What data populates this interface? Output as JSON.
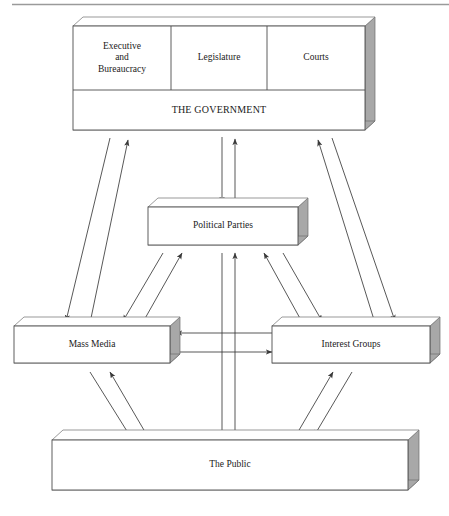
{
  "figure": {
    "type": "flow-diagram",
    "title": "",
    "has_top_rule": true,
    "background_color": "#ffffff",
    "line_color": "#333333",
    "box_fill": "#ffffff",
    "box_stroke": "#4d4d4d",
    "shadow_color": "#a8a8a8"
  },
  "nodes": {
    "government_group": {
      "name": "THE GOVERNMENT",
      "cells": [
        {
          "id": "executive",
          "label": "Executive\nand\nBureaucracy",
          "line1": "Executive",
          "line2": "and",
          "line3": "Bureaucracy"
        },
        {
          "id": "legislature",
          "label": "Legislature"
        },
        {
          "id": "courts",
          "label": "Courts"
        }
      ],
      "footer_label": "THE GOVERNMENT"
    },
    "political_parties": {
      "id": "political-parties",
      "label": "Political Parties"
    },
    "mass_media": {
      "id": "mass-media",
      "label": "Mass Media"
    },
    "interest_groups": {
      "id": "interest-groups",
      "label": "Interest Groups"
    },
    "the_public": {
      "id": "the-public",
      "label": "The Public"
    }
  },
  "connections": [
    {
      "from": "THE GOVERNMENT",
      "to": "Political Parties",
      "direction": "bidirectional",
      "style": "vertical-pair"
    },
    {
      "from": "THE GOVERNMENT",
      "to": "Mass Media",
      "direction": "bidirectional",
      "style": "diagonal-pair"
    },
    {
      "from": "THE GOVERNMENT",
      "to": "Interest Groups",
      "direction": "bidirectional",
      "style": "diagonal-pair"
    },
    {
      "from": "Political Parties",
      "to": "Mass Media",
      "direction": "bidirectional",
      "style": "diagonal-pair"
    },
    {
      "from": "Political Parties",
      "to": "Interest Groups",
      "direction": "bidirectional",
      "style": "diagonal-pair"
    },
    {
      "from": "Political Parties",
      "to": "The Public",
      "direction": "bidirectional",
      "style": "vertical-pair"
    },
    {
      "from": "Mass Media",
      "to": "Interest Groups",
      "direction": "bidirectional",
      "style": "horizontal-pair"
    },
    {
      "from": "Mass Media",
      "to": "The Public",
      "direction": "bidirectional",
      "style": "diagonal-pair"
    },
    {
      "from": "Interest Groups",
      "to": "The Public",
      "direction": "bidirectional",
      "style": "diagonal-pair"
    }
  ]
}
